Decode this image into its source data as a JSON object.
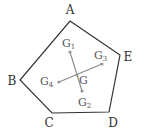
{
  "diagram": {
    "type": "geometry",
    "colors": {
      "outline": "#333333",
      "segment": "#888888",
      "point": "#999999",
      "label": "#333333"
    },
    "vertices": [
      {
        "id": "A",
        "label": "A",
        "x": 70,
        "y": 21,
        "lx": 70,
        "ly": 14
      },
      {
        "id": "E",
        "label": "E",
        "x": 120,
        "y": 55,
        "lx": 128,
        "ly": 61
      },
      {
        "id": "D",
        "label": "D",
        "x": 109,
        "y": 112,
        "lx": 113,
        "ly": 127
      },
      {
        "id": "C",
        "label": "C",
        "x": 52,
        "y": 113,
        "lx": 49,
        "ly": 127
      },
      {
        "id": "B",
        "label": "B",
        "x": 20,
        "y": 80,
        "lx": 12,
        "ly": 85
      }
    ],
    "points": [
      {
        "id": "G1",
        "label": "G",
        "sub": "1",
        "x": 70,
        "y": 52,
        "lx": 62,
        "ly": 47
      },
      {
        "id": "G2",
        "label": "G",
        "sub": "2",
        "x": 82,
        "y": 91,
        "lx": 78,
        "ly": 106
      },
      {
        "id": "G3",
        "label": "G",
        "sub": "3",
        "x": 102,
        "y": 64,
        "lx": 94,
        "ly": 59
      },
      {
        "id": "G4",
        "label": "G",
        "sub": "4",
        "x": 59,
        "y": 82,
        "lx": 40,
        "ly": 85
      },
      {
        "id": "G",
        "label": "G",
        "sub": "",
        "x": 77,
        "y": 75,
        "lx": 79,
        "ly": 84
      }
    ],
    "segments": [
      {
        "from": "G1",
        "to": "G2"
      },
      {
        "from": "G3",
        "to": "G4"
      }
    ]
  }
}
